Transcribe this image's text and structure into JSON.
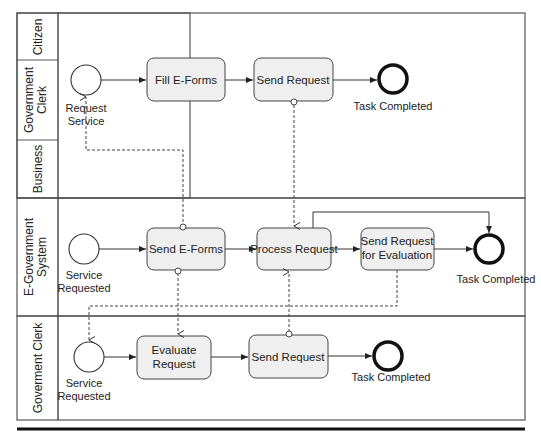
{
  "pools": [
    {
      "name": "citizen-pool",
      "lanes": [
        {
          "label": [
            "Citizen"
          ]
        },
        {
          "label": [
            "Government",
            "Clerk"
          ]
        },
        {
          "label": [
            "Business"
          ]
        }
      ],
      "start_event": {
        "label": [
          "Request",
          "Service"
        ]
      },
      "tasks": [
        {
          "label": [
            "Fill E-Forms"
          ]
        },
        {
          "label": [
            "Send Request"
          ]
        }
      ],
      "end_event": {
        "label": [
          "Task Completed"
        ]
      }
    },
    {
      "name": "egov-pool",
      "lanes": [
        {
          "label": [
            "E-Government",
            "System"
          ]
        }
      ],
      "start_event": {
        "label": [
          "Service",
          "Requested"
        ]
      },
      "tasks": [
        {
          "label": [
            "Send E-Forms"
          ]
        },
        {
          "label": [
            "Process Request"
          ]
        },
        {
          "label": [
            "Send Request",
            "for Evaluation"
          ]
        }
      ],
      "end_event": {
        "label": [
          "Task Completed"
        ]
      }
    },
    {
      "name": "clerk-pool",
      "lanes": [
        {
          "label": [
            "Goverment Clerk"
          ]
        }
      ],
      "start_event": {
        "label": [
          "Service",
          "Requested"
        ]
      },
      "tasks": [
        {
          "label": [
            "Evaluate",
            "Request"
          ]
        },
        {
          "label": [
            "Send Request"
          ]
        }
      ],
      "end_event": {
        "label": [
          "Task Completed"
        ]
      }
    }
  ],
  "colors": {
    "task_fill": "#efefef",
    "stroke": "#333333",
    "lane_border": "#555555"
  }
}
